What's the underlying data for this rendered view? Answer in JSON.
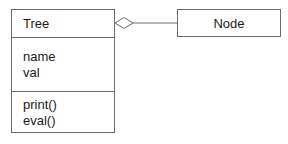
{
  "diagram": {
    "type": "uml-class-diagram",
    "classes": [
      {
        "id": "tree",
        "name": "Tree",
        "attributes": [
          "name",
          "val"
        ],
        "operations": [
          "print()",
          "eval()"
        ]
      },
      {
        "id": "node",
        "name": "Node",
        "attributes": [],
        "operations": []
      }
    ],
    "relationships": [
      {
        "type": "aggregation",
        "from": "Tree",
        "to": "Node",
        "diamond_at": "Tree"
      }
    ]
  },
  "colors": {
    "border": "#6b6b6b",
    "text": "#1a1a1a",
    "background": "#ffffff"
  }
}
